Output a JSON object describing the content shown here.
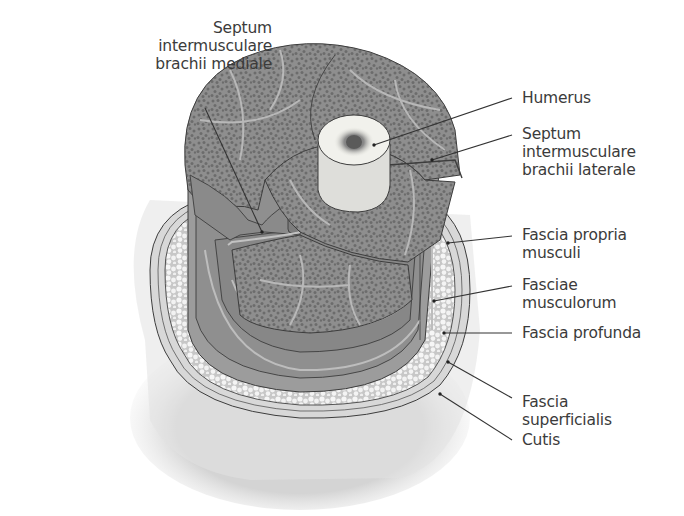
{
  "figure": {
    "colors": {
      "background": "#ffffff",
      "muscle_base": "#8c8c8c",
      "muscle_fiber": "#6f6f6f",
      "muscle_septa": "#b4b4b4",
      "fascia_band": "#9a9a9a",
      "fascia_band_dark": "#7e7e7e",
      "fat": "#cfcfcf",
      "fat_lobule": "#f4f4f4",
      "bone_outer": "#efefe8",
      "bone_marrow": "#6a6a6a",
      "skin_shadow": "#dadada",
      "outline": "#3d3d3d",
      "label_text": "#3b3b3b"
    }
  },
  "labels": {
    "left": [
      {
        "id": "septum-mediale",
        "lines": [
          "Septum",
          "intermusculare",
          "brachii mediale"
        ]
      }
    ],
    "right": [
      {
        "id": "humerus",
        "lines": [
          "Humerus"
        ]
      },
      {
        "id": "septum-laterale",
        "lines": [
          "Septum",
          "intermusculare",
          "brachii laterale"
        ]
      },
      {
        "id": "fascia-propria",
        "lines": [
          "Fascia propria",
          "musculi"
        ]
      },
      {
        "id": "fasciae-musculorum",
        "lines": [
          "Fasciae",
          "musculorum"
        ]
      },
      {
        "id": "fascia-profunda",
        "lines": [
          "Fascia profunda"
        ]
      },
      {
        "id": "fascia-superficialis",
        "lines": [
          "Fascia",
          "superficialis"
        ]
      },
      {
        "id": "cutis",
        "lines": [
          "Cutis"
        ]
      }
    ]
  }
}
